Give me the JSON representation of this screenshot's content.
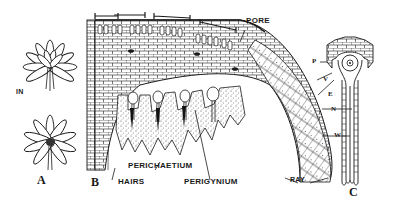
{
  "figure": {
    "panels": [
      {
        "id": "A",
        "label": "A",
        "description": "Two rosette-like clusters viewed from above"
      },
      {
        "id": "B",
        "label": "B",
        "description": "Longitudinal section of a head showing cellular structure"
      },
      {
        "id": "C",
        "label": "C",
        "description": "Single elongated archegonium-like structure"
      }
    ],
    "labels": {
      "in": "IN",
      "a": "A",
      "b": "B",
      "c": "C",
      "pore": "PORE",
      "hairs": "HAIRS",
      "perichaetium": "PERICHAETIUM",
      "perigynium": "PERIGYNIUM",
      "ray": "RAY",
      "p": "P",
      "v": "V",
      "e": "E",
      "n": "N",
      "w": "W"
    },
    "colors": {
      "ink": "#1a1a1a",
      "paper": "#ffffff"
    }
  }
}
